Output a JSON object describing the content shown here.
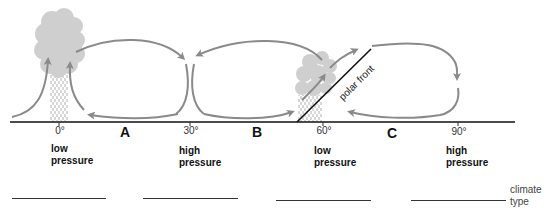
{
  "diagram": {
    "latitudes": [
      {
        "label": "0°",
        "pressure": [
          "low",
          "pressure"
        ]
      },
      {
        "label": "30°",
        "pressure": [
          "high",
          "pressure"
        ]
      },
      {
        "label": "60°",
        "pressure": [
          "low",
          "pressure"
        ]
      },
      {
        "label": "90°",
        "pressure": [
          "high",
          "pressure"
        ]
      }
    ],
    "zones": [
      "A",
      "B",
      "C"
    ],
    "front_label": "polar front",
    "answer_prompt": [
      "climate",
      "type"
    ],
    "answer_blanks": [
      "",
      "",
      "",
      ""
    ],
    "colors": {
      "arrow": "#8a8a8a",
      "cloud": "#cfcfcf",
      "rain": "#9a9a9a",
      "ground": "#111111"
    }
  }
}
